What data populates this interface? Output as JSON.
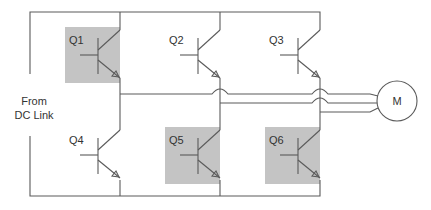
{
  "source_label": {
    "line1": "From",
    "line2": "DC Link"
  },
  "motor": {
    "label": "M",
    "cx": 397,
    "cy": 101,
    "r": 20
  },
  "colors": {
    "wire": "#5a5a5a",
    "shade": "#c4c4c4",
    "text": "#333333",
    "background": "#ffffff"
  },
  "switches": [
    {
      "id": "Q1",
      "label": "Q1",
      "leg": 1,
      "position": "upper",
      "shaded": true,
      "rail_x": 120,
      "top": 28
    },
    {
      "id": "Q2",
      "label": "Q2",
      "leg": 2,
      "position": "upper",
      "shaded": false,
      "rail_x": 220,
      "top": 28
    },
    {
      "id": "Q3",
      "label": "Q3",
      "leg": 3,
      "position": "upper",
      "shaded": false,
      "rail_x": 320,
      "top": 28
    },
    {
      "id": "Q4",
      "label": "Q4",
      "leg": 1,
      "position": "lower",
      "shaded": false,
      "rail_x": 120,
      "top": 128
    },
    {
      "id": "Q5",
      "label": "Q5",
      "leg": 2,
      "position": "lower",
      "shaded": true,
      "rail_x": 220,
      "top": 128
    },
    {
      "id": "Q6",
      "label": "Q6",
      "leg": 3,
      "position": "lower",
      "shaded": true,
      "rail_x": 320,
      "top": 128
    }
  ],
  "phases": [
    {
      "name": "A",
      "from_leg": 1,
      "y": 94
    },
    {
      "name": "B",
      "from_leg": 2,
      "y": 103
    },
    {
      "name": "C",
      "from_leg": 3,
      "y": 112
    }
  ]
}
